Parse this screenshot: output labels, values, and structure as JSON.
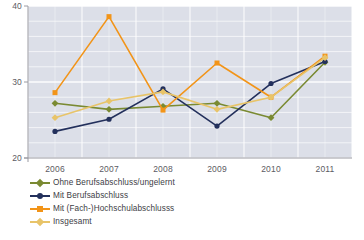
{
  "chart_data": {
    "type": "line",
    "title": "",
    "subtitle": "",
    "xlabel": "",
    "ylabel": "",
    "categories": [
      "2006",
      "2007",
      "2008",
      "2009",
      "2010",
      "2011"
    ],
    "ylim": [
      20,
      40
    ],
    "yticks": [
      "20",
      "30",
      "40"
    ],
    "grid": true,
    "legend_position": "below-left",
    "series": [
      {
        "name": "Ohne Berufsabschluss/ungelernt",
        "color": "#7a8a32",
        "marker": "diamond",
        "values": [
          27.2,
          26.4,
          26.8,
          27.2,
          25.3,
          32.6
        ]
      },
      {
        "name": "Mit Berufsabschluss",
        "color": "#23305c",
        "marker": "circle",
        "values": [
          23.5,
          25.1,
          29.1,
          24.2,
          29.8,
          32.7
        ]
      },
      {
        "name": "Mit (Fach-)Hochschulabschlusss",
        "color": "#f29418",
        "marker": "square",
        "values": [
          28.6,
          38.6,
          26.3,
          32.5,
          28.0,
          33.4
        ]
      },
      {
        "name": "Insgesamt",
        "color": "#e8c469",
        "marker": "diamond",
        "values": [
          25.3,
          27.5,
          28.7,
          26.4,
          28.0,
          33.2
        ]
      }
    ]
  }
}
